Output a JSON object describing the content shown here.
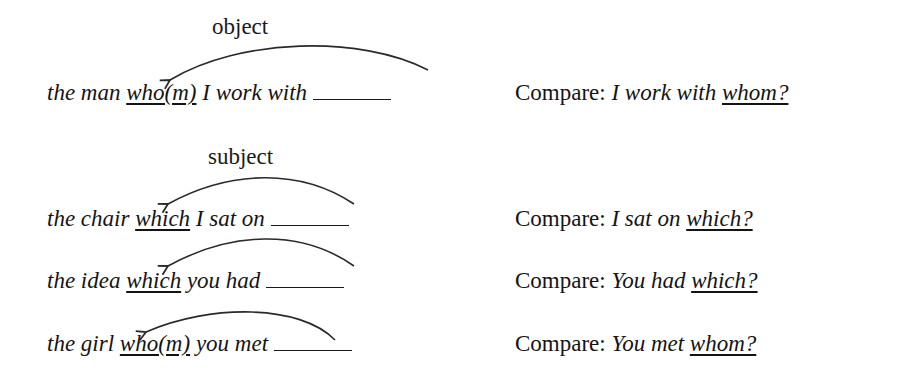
{
  "labels": {
    "object": "object",
    "subject": "subject"
  },
  "examples": [
    {
      "before": "the man ",
      "relative": "who(m)",
      "after": " I work with",
      "compare_prefix": "Compare: ",
      "compare_phrase": "I work with ",
      "compare_wh": "whom?"
    },
    {
      "before": "the chair ",
      "relative": "which",
      "after": " I sat on",
      "compare_prefix": "Compare: ",
      "compare_phrase": "I sat on ",
      "compare_wh": "which?"
    },
    {
      "before": "the idea ",
      "relative": "which",
      "after": " you had",
      "compare_prefix": "Compare: ",
      "compare_phrase": "You had ",
      "compare_wh": "which?"
    },
    {
      "before": "the girl ",
      "relative": "who(m)",
      "after": " you met",
      "compare_prefix": "Compare: ",
      "compare_phrase": "You met ",
      "compare_wh": "whom?"
    }
  ],
  "colors": {
    "text": "#141414",
    "background": "#ffffff",
    "arrow": "#2a2a2a"
  }
}
